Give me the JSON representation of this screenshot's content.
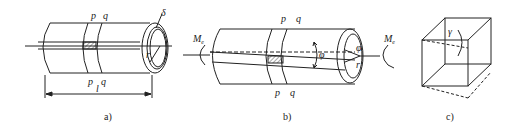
{
  "figure_a": {
    "caption": "a)",
    "section_top": [
      "p",
      "q"
    ],
    "section_bottom": [
      "p",
      "q"
    ],
    "length_label": "l",
    "radius_label": "r",
    "thickness_label": "δ"
  },
  "figure_b": {
    "caption": "b)",
    "section_top": [
      "p",
      "q"
    ],
    "section_bottom": [
      "p",
      "q"
    ],
    "torque_label": "M",
    "torque_sub": "e",
    "twist_angle_label": "φ",
    "end_angle_label": "φ",
    "radius_label": "r"
  },
  "figure_c": {
    "caption": "c)",
    "shear_strain_label": "γ"
  },
  "colors": {
    "stroke": "#222222",
    "background": "#ffffff"
  }
}
